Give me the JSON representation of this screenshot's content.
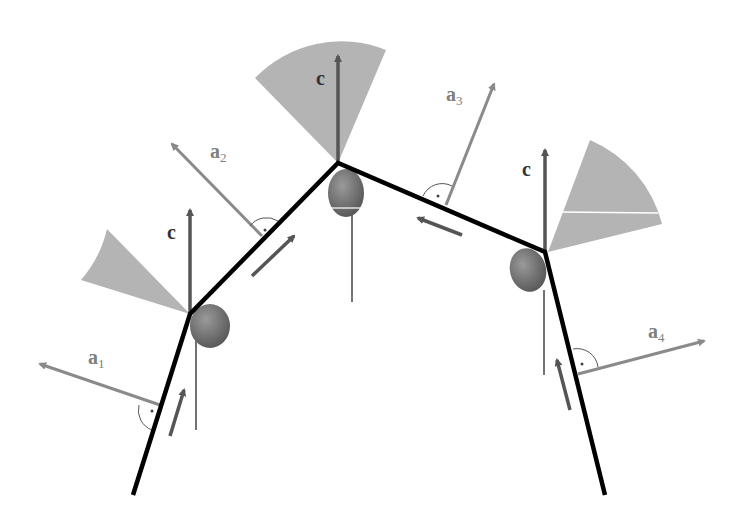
{
  "diagram": {
    "colors": {
      "chain": "#000000",
      "c_arrow": "#555555",
      "a_arrow": "#8a8a8a",
      "sector": "#b4b4b4",
      "joint": "#707070",
      "label_c": "#333333",
      "label_a": "#808080"
    },
    "labels": {
      "c": "c",
      "a": "a",
      "a1_sub": "1",
      "a2_sub": "2",
      "a3_sub": "3",
      "a4_sub": "4"
    }
  }
}
